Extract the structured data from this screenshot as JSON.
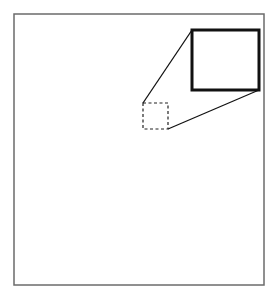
{
  "canvas": {
    "width": 278,
    "height": 301,
    "background": "#ffffff"
  },
  "frame": {
    "x": 14,
    "y": 14,
    "width": 250,
    "height": 271,
    "stroke": "#6b6b6b",
    "stroke_width": 1.5
  },
  "source_region": {
    "x": 143,
    "y": 103,
    "width": 25,
    "height": 26,
    "stroke": "#222222",
    "stroke_width": 1.2,
    "dash": "3,2.5",
    "style": "dashed"
  },
  "magnified_region": {
    "x": 192,
    "y": 30,
    "width": 67,
    "height": 60,
    "stroke": "#111111",
    "stroke_width": 3,
    "style": "solid"
  },
  "connectors": [
    {
      "x1": 143,
      "y1": 103,
      "x2": 192,
      "y2": 30
    },
    {
      "x1": 168,
      "y1": 129,
      "x2": 259,
      "y2": 90
    }
  ],
  "connector_style": {
    "stroke": "#111111",
    "stroke_width": 1.3
  }
}
